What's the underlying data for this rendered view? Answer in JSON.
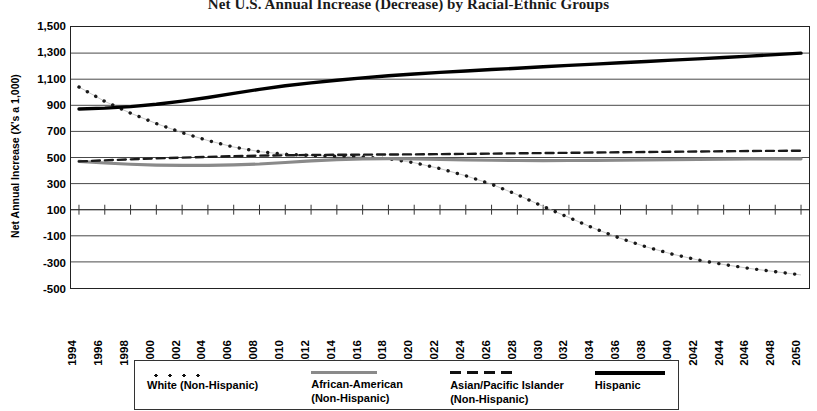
{
  "chart_data": {
    "type": "line",
    "title": "Net U.S. Annual Increase (Decrease) by Racial-Ethnic Groups",
    "xlabel": "",
    "ylabel": "Net Annual Increase (X's a 1,000)",
    "ylim": [
      -500,
      1500
    ],
    "ytick_step": 200,
    "ytick_labels": [
      "1,500",
      "1,300",
      "1,100",
      "900",
      "700",
      "500",
      "300",
      "100",
      "-100",
      "-300",
      "-500"
    ],
    "grid": true,
    "legend_position": "bottom",
    "x": [
      1994,
      1996,
      1998,
      2000,
      2002,
      2004,
      2006,
      2008,
      2010,
      2012,
      2014,
      2016,
      2018,
      2020,
      2022,
      2024,
      2026,
      2028,
      2030,
      2032,
      2034,
      2036,
      2038,
      2040,
      2042,
      2044,
      2046,
      2048,
      2050
    ],
    "xtick_labels": [
      "1994",
      "1996",
      "1998",
      "2000",
      "2002",
      "2004",
      "2006",
      "2008",
      "2010",
      "2012",
      "2014",
      "2016",
      "2018",
      "2020",
      "2022",
      "2024",
      "2026",
      "2028",
      "2030",
      "2032",
      "2034",
      "2036",
      "2038",
      "2040",
      "2042",
      "2044",
      "2046",
      "2048",
      "2050"
    ],
    "series": [
      {
        "name": "White (Non-Hispanic)",
        "style": "dotted",
        "color": "#1a1a1a",
        "values": [
          1040,
          930,
          840,
          760,
          690,
          630,
          580,
          545,
          525,
          515,
          510,
          505,
          490,
          460,
          415,
          360,
          295,
          215,
          125,
          40,
          -45,
          -120,
          -185,
          -240,
          -285,
          -320,
          -350,
          -375,
          -400
        ]
      },
      {
        "name": "African-American (Non-Hispanic)",
        "style": "solid-thick",
        "color": "#8a8a8a",
        "values": [
          470,
          458,
          448,
          442,
          440,
          440,
          443,
          450,
          462,
          474,
          484,
          490,
          492,
          490,
          486,
          482,
          479,
          477,
          476,
          477,
          478,
          480,
          482,
          484,
          486,
          488,
          489,
          490,
          490
        ]
      },
      {
        "name": "Asian/Pacific Islander (Non-Hispanic)",
        "style": "dashed",
        "color": "#1a1a1a",
        "values": [
          470,
          478,
          486,
          493,
          499,
          505,
          510,
          514,
          517,
          519,
          521,
          522,
          523,
          524,
          526,
          528,
          530,
          532,
          534,
          536,
          538,
          540,
          542,
          544,
          546,
          548,
          550,
          551,
          552
        ]
      },
      {
        "name": "Hispanic",
        "style": "solid-black",
        "color": "#000000",
        "values": [
          872,
          878,
          890,
          908,
          932,
          960,
          992,
          1022,
          1050,
          1072,
          1092,
          1110,
          1126,
          1140,
          1152,
          1163,
          1174,
          1184,
          1195,
          1206,
          1216,
          1226,
          1236,
          1246,
          1256,
          1266,
          1277,
          1288,
          1300
        ]
      }
    ]
  },
  "legend": {
    "items": [
      {
        "label": "White (Non-Hispanic)",
        "marker": "dotted-line-swatch"
      },
      {
        "label": "African-American\n(Non-Hispanic)",
        "marker": "gray-solid-line-swatch"
      },
      {
        "label": "Asian/Pacific Islander\n(Non-Hispanic)",
        "marker": "dashed-line-swatch"
      },
      {
        "label": "Hispanic",
        "marker": "black-solid-line-swatch"
      }
    ]
  }
}
